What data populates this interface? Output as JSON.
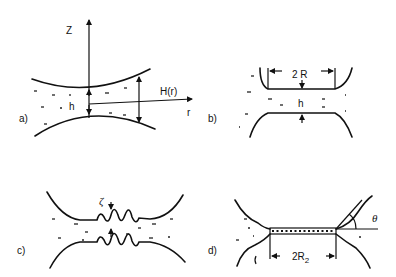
{
  "figure": {
    "panels": [
      {
        "id": "a",
        "label": "a)",
        "axis_z": "Z",
        "axis_r": "r",
        "gap_label": "h",
        "height_label": "H(r)"
      },
      {
        "id": "b",
        "label": "b)",
        "width_label": "2 R",
        "gap_label": "h"
      },
      {
        "id": "c",
        "label": "c)",
        "amplitude_label": "ζ"
      },
      {
        "id": "d",
        "label": "d)",
        "width_label_main": "2R",
        "width_label_sub": "2",
        "angle_label": "θ"
      }
    ]
  }
}
